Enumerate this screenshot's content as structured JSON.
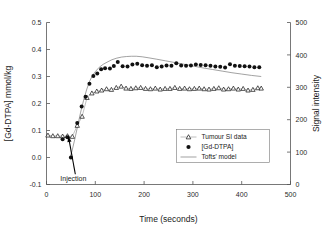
{
  "figure": {
    "background_color": "#ffffff",
    "frame_color": "#555555"
  },
  "chart_data": {
    "type": "scatter",
    "title": "",
    "subtitle": "",
    "xlabel": "Time (seconds)",
    "ylabel": "[Gd-DTPA] mmol/kg",
    "y2label": "Signal intensity",
    "xlim": [
      0,
      500
    ],
    "ylim": [
      -0.1,
      0.5
    ],
    "y2lim": [
      0,
      500
    ],
    "xticks": [
      0,
      100,
      200,
      300,
      400,
      500
    ],
    "xticklabels": [
      "0",
      "100",
      "200",
      "300",
      "400",
      "500"
    ],
    "yticks": [
      -0.1,
      0.0,
      0.1,
      0.2,
      0.3,
      0.4,
      0.5
    ],
    "yticklabels": [
      "-0.1",
      "0.0",
      "0.1",
      "0.2",
      "0.3",
      "0.4",
      "0.5"
    ],
    "y2ticks": [
      0,
      100,
      200,
      300,
      400,
      500
    ],
    "y2ticklabels": [
      "0",
      "100",
      "200",
      "300",
      "400",
      "500"
    ],
    "grid": false,
    "legend_position": "center-right",
    "annotations": [
      {
        "text": "Injection",
        "x": 45,
        "y": 0.085,
        "label_x": 55,
        "label_y": -0.062
      }
    ],
    "series": [
      {
        "name": "Tumour SI data",
        "marker": "triangle-open",
        "line": true,
        "axis": "right",
        "x": [
          3,
          13,
          23,
          33,
          43,
          53,
          63,
          73,
          83,
          93,
          103,
          113,
          123,
          133,
          143,
          153,
          163,
          173,
          183,
          193,
          203,
          213,
          223,
          233,
          243,
          253,
          263,
          273,
          283,
          293,
          303,
          313,
          323,
          333,
          343,
          353,
          363,
          373,
          383,
          393,
          403,
          413,
          423,
          433,
          440
        ],
        "values": [
          0.081,
          0.08,
          0.08,
          0.079,
          0.08,
          0.079,
          0.118,
          0.152,
          0.221,
          0.238,
          0.245,
          0.249,
          0.253,
          0.251,
          0.257,
          0.262,
          0.255,
          0.254,
          0.256,
          0.257,
          0.254,
          0.253,
          0.255,
          0.251,
          0.254,
          0.254,
          0.257,
          0.254,
          0.255,
          0.253,
          0.254,
          0.255,
          0.253,
          0.252,
          0.254,
          0.256,
          0.251,
          0.253,
          0.255,
          0.251,
          0.254,
          0.248,
          0.25,
          0.256,
          0.255
        ],
        "values_right_axis": [
          152,
          150,
          150,
          149,
          150,
          148,
          182,
          210,
          268,
          282,
          288,
          291,
          295,
          293,
          299,
          303,
          297,
          296,
          298,
          299,
          296,
          295,
          297,
          294,
          296,
          296,
          299,
          296,
          297,
          295,
          296,
          297,
          295,
          294,
          296,
          298,
          294,
          295,
          297,
          294,
          296,
          291,
          293,
          298,
          297
        ]
      },
      {
        "name": "[Gd-DTPA]",
        "marker": "circle-filled",
        "line": false,
        "axis": "left",
        "x": [
          33,
          43,
          50,
          63,
          72,
          80,
          88,
          96,
          104,
          112,
          120,
          130,
          138,
          146,
          156,
          166,
          176,
          186,
          196,
          206,
          216,
          226,
          236,
          246,
          256,
          266,
          276,
          286,
          296,
          306,
          316,
          326,
          336,
          346,
          356,
          366,
          376,
          386,
          396,
          406,
          416,
          426,
          436
        ],
        "values": [
          0.068,
          0.075,
          0.0,
          0.128,
          0.189,
          0.225,
          0.273,
          0.302,
          0.311,
          0.327,
          0.331,
          0.33,
          0.339,
          0.354,
          0.338,
          0.337,
          0.344,
          0.347,
          0.342,
          0.34,
          0.342,
          0.334,
          0.337,
          0.341,
          0.34,
          0.349,
          0.341,
          0.34,
          0.341,
          0.344,
          0.343,
          0.342,
          0.34,
          0.337,
          0.336,
          0.333,
          0.345,
          0.34,
          0.339,
          0.338,
          0.337,
          0.334,
          0.334
        ]
      },
      {
        "name": "Tofts' model",
        "marker": "none",
        "line": true,
        "axis": "left",
        "x": [
          48,
          52,
          58,
          64,
          70,
          76,
          82,
          88,
          94,
          100,
          108,
          116,
          124,
          134,
          144,
          154,
          164,
          174,
          184,
          196,
          210,
          226,
          244,
          262,
          280,
          300,
          320,
          340,
          360,
          380,
          400,
          420,
          440
        ],
        "values": [
          0.0,
          0.022,
          0.068,
          0.118,
          0.168,
          0.212,
          0.25,
          0.281,
          0.303,
          0.318,
          0.334,
          0.345,
          0.353,
          0.362,
          0.368,
          0.372,
          0.374,
          0.375,
          0.375,
          0.373,
          0.369,
          0.364,
          0.358,
          0.352,
          0.346,
          0.339,
          0.332,
          0.326,
          0.32,
          0.314,
          0.309,
          0.304,
          0.3
        ]
      }
    ]
  },
  "legend": {
    "items": [
      {
        "label": "Tumour SI data",
        "marker": "triangle-open-with-line"
      },
      {
        "label": "[Gd-DTPA]",
        "marker": "circle-filled"
      },
      {
        "label": "Tofts' model",
        "marker": "line"
      }
    ]
  }
}
